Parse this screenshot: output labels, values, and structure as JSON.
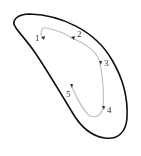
{
  "diagram": {
    "outline_color": "#111111",
    "path_color": "#bbbbbb",
    "marker_color": "#333333",
    "points": [
      {
        "label": "1",
        "x": 41,
        "y": 36,
        "lx": 35,
        "ly": 41
      },
      {
        "label": "2",
        "x": 72,
        "y": 38,
        "lx": 77,
        "ly": 37
      },
      {
        "label": "3",
        "x": 100,
        "y": 63,
        "lx": 104,
        "ly": 66
      },
      {
        "label": "4",
        "x": 103,
        "y": 108,
        "lx": 107,
        "ly": 113
      },
      {
        "label": "5",
        "x": 71,
        "y": 85,
        "lx": 66,
        "ly": 97
      }
    ]
  }
}
